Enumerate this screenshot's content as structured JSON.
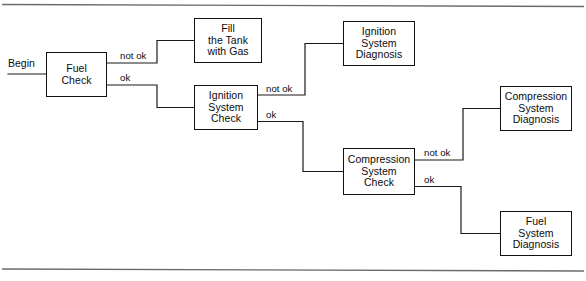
{
  "diagram": {
    "type": "flowchart",
    "start_label": "Begin",
    "line_color": "#111111",
    "rule_color": "#6a6a6a",
    "background": "#ffffff",
    "nodes": [
      {
        "id": "fuel-check",
        "label": "Fuel\nCheck",
        "x": 46,
        "y": 52,
        "w": 61,
        "h": 45
      },
      {
        "id": "fill-tank",
        "label": "Fill\nthe Tank\nwith Gas",
        "x": 194,
        "y": 18,
        "w": 68,
        "h": 45
      },
      {
        "id": "ignition-check",
        "label": "Ignition\nSystem\nCheck",
        "x": 194,
        "y": 85,
        "w": 64,
        "h": 45
      },
      {
        "id": "ignition-diagnosis",
        "label": "Ignition\nSystem\nDiagnosis",
        "x": 343,
        "y": 21,
        "w": 72,
        "h": 45
      },
      {
        "id": "compression-check",
        "label": "Compression\nSystem\nCheck",
        "x": 343,
        "y": 148,
        "w": 72,
        "h": 47
      },
      {
        "id": "compression-diagnosis",
        "label": "Compression\nSystem\nDiagnosis",
        "x": 500,
        "y": 86,
        "w": 72,
        "h": 45
      },
      {
        "id": "fuel-diagnosis",
        "label": "Fuel\nSystem\nDiagnosis",
        "x": 500,
        "y": 211,
        "w": 72,
        "h": 45
      }
    ],
    "edges": [
      {
        "id": "begin-to-fuel-check",
        "label": "",
        "from": "start",
        "to": "fuel-check"
      },
      {
        "id": "fuel-check-not-ok",
        "label": "not ok",
        "from": "fuel-check",
        "to": "fill-tank",
        "label_x": 120,
        "label_y": 51
      },
      {
        "id": "fuel-check-ok",
        "label": "ok",
        "from": "fuel-check",
        "to": "ignition-check",
        "label_x": 120,
        "label_y": 73
      },
      {
        "id": "ignition-check-not-ok",
        "label": "not ok",
        "from": "ignition-check",
        "to": "ignition-diagnosis",
        "label_x": 266,
        "label_y": 84
      },
      {
        "id": "ignition-check-ok",
        "label": "ok",
        "from": "ignition-check",
        "to": "compression-check",
        "label_x": 266,
        "label_y": 110
      },
      {
        "id": "compression-check-not-ok",
        "label": "not ok",
        "from": "compression-check",
        "to": "compression-diagnosis",
        "label_x": 424,
        "label_y": 148
      },
      {
        "id": "compression-check-ok",
        "label": "ok",
        "from": "compression-check",
        "to": "fuel-diagnosis",
        "label_x": 424,
        "label_y": 175
      }
    ]
  }
}
